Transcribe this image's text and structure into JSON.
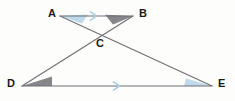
{
  "figure": {
    "background_color": "#fdfdfc",
    "line_color": "#6f6f72",
    "marker_color": "#a8cfe6",
    "angle_fill_light": "#bcd9ea",
    "angle_fill_dark": "#7f8084",
    "label_color": "#1b1b1b"
  },
  "points": [
    {
      "id": "A",
      "label": "A",
      "x": 60,
      "y": 16,
      "label_x": 48,
      "label_y": 9
    },
    {
      "id": "B",
      "label": "B",
      "x": 133,
      "y": 16,
      "label_x": 139,
      "label_y": 9
    },
    {
      "id": "C",
      "label": "C",
      "x": 100,
      "y": 36,
      "label_x": 96,
      "label_y": 38
    },
    {
      "id": "D",
      "label": "D",
      "x": 22,
      "y": 86,
      "label_x": 8,
      "label_y": 79
    },
    {
      "id": "E",
      "label": "E",
      "x": 212,
      "y": 86,
      "label_x": 218,
      "label_y": 79
    }
  ],
  "segments": [
    {
      "name": "segment-AB",
      "from": "A",
      "to": "B",
      "parallel_mark": 1
    },
    {
      "name": "segment-DE",
      "from": "D",
      "to": "E",
      "parallel_mark": 1
    },
    {
      "name": "segment-AE",
      "from": "A",
      "to": "E",
      "parallel_mark": 0
    },
    {
      "name": "segment-DB",
      "from": "D",
      "to": "B",
      "parallel_mark": 0
    }
  ],
  "angle_markers": [
    {
      "name": "angle-marker-A",
      "vertex": "A",
      "shade": "light"
    },
    {
      "name": "angle-marker-B",
      "vertex": "B",
      "shade": "dark"
    },
    {
      "name": "angle-marker-D",
      "vertex": "D",
      "shade": "dark"
    },
    {
      "name": "angle-marker-E",
      "vertex": "E",
      "shade": "light"
    }
  ],
  "parallel_arrows": [
    {
      "name": "parallel-arrow-ab",
      "on": "segment-AB",
      "x": 94,
      "y": 16
    },
    {
      "name": "parallel-arrow-de",
      "on": "segment-DE",
      "x": 117,
      "y": 86
    }
  ]
}
